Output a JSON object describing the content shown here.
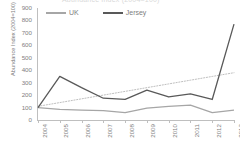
{
  "title": "Abundance Index (2004=100)",
  "colors": {
    "uk_line": "#a6a6a6",
    "jersey_line": "#595959",
    "trendline": "#bfbfbf",
    "axis": "#bfbfbf",
    "tick_text": "#808080"
  },
  "legend": {
    "items": [
      {
        "label": "UK",
        "color": "#a6a6a6"
      },
      {
        "label": "Jersey",
        "color": "#595959"
      }
    ]
  },
  "axes": {
    "y_title": "Abundance Index (2004=100)",
    "y_ticks": [
      "900",
      "800",
      "700",
      "600",
      "500",
      "400",
      "300",
      "200",
      "100",
      "0"
    ],
    "x_ticks": [
      "2004",
      "2005",
      "2006",
      "2007",
      "2008",
      "2009",
      "2010",
      "2011",
      "2012",
      "2013"
    ]
  },
  "chart_data": {
    "type": "line",
    "title": "Abundance Index (2004=100)",
    "xlabel": "",
    "ylabel": "Abundance Index (2004=100)",
    "ylim": [
      0,
      900
    ],
    "ytick_step": 100,
    "grid": false,
    "legend_position": "top",
    "categories": [
      "2004",
      "2005",
      "2006",
      "2007",
      "2008",
      "2009",
      "2010",
      "2011",
      "2012",
      "2013"
    ],
    "series": [
      {
        "name": "UK",
        "color": "#a6a6a6",
        "style": "solid",
        "values": [
          100,
          85,
          80,
          75,
          60,
          95,
          110,
          120,
          60,
          80
        ]
      },
      {
        "name": "Jersey",
        "color": "#595959",
        "style": "solid",
        "values": [
          100,
          350,
          260,
          175,
          165,
          240,
          185,
          210,
          165,
          770
        ]
      },
      {
        "name": "Trendline",
        "color": "#bfbfbf",
        "style": "dotted",
        "in_legend": false,
        "values": [
          110,
          140,
          170,
          200,
          230,
          260,
          290,
          320,
          350,
          380
        ]
      }
    ]
  }
}
